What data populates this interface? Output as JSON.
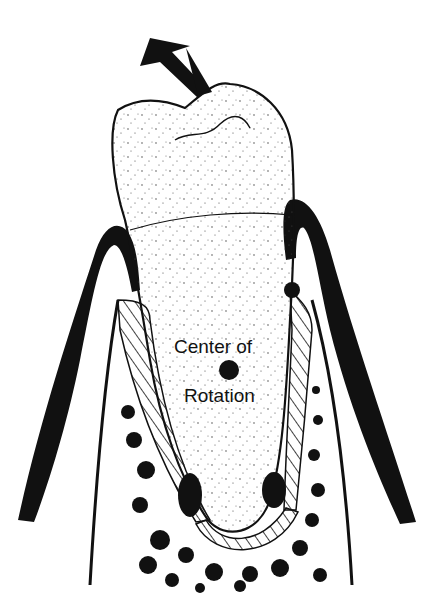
{
  "diagram": {
    "labels": {
      "center_line1": "Center of",
      "center_line2": "Rotation"
    },
    "elements": [
      "force-arrow",
      "tooth-crown",
      "tooth-root",
      "gingiva-left",
      "gingiva-right",
      "pdl-hatch-left",
      "pdl-hatch-right",
      "pdl-hatch-apex",
      "alveolar-bone",
      "center-of-rotation-dot"
    ],
    "colors": {
      "ink": "#111111",
      "background": "#ffffff"
    }
  }
}
